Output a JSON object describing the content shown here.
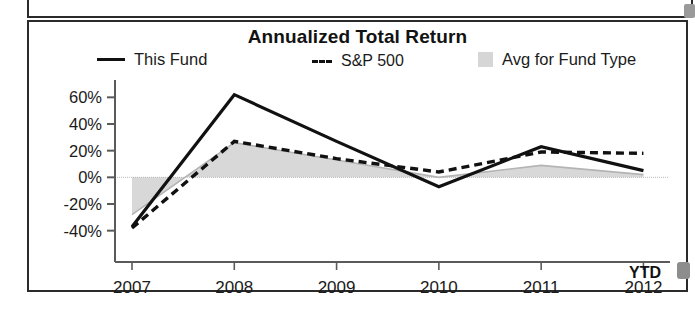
{
  "panel": {
    "title": "Annualized Total Return"
  },
  "legend": {
    "items": [
      {
        "label": "This Fund",
        "marker": "solid-line",
        "color": "#111111"
      },
      {
        "label": "S&P 500",
        "marker": "dashed-line",
        "color": "#111111"
      },
      {
        "label": "Avg for Fund Type",
        "marker": "shaded-area",
        "color": "#d6d6d6"
      }
    ]
  },
  "axis": {
    "x_suffix_label": "YTD",
    "y_ticks": [
      "60%",
      "40%",
      "20%",
      "0%",
      "-20%",
      "-40%"
    ],
    "x_ticks": [
      "2007",
      "2008",
      "2009",
      "2010",
      "2011",
      "2012"
    ]
  },
  "chart_data": {
    "type": "line",
    "title": "Annualized Total Return",
    "xlabel": "",
    "ylabel": "",
    "x": [
      "2007",
      "2008",
      "2009",
      "2010",
      "2011",
      "2012"
    ],
    "x_note": "2012 value is YTD",
    "ylim": [
      -50,
      70
    ],
    "y_ticks": [
      -40,
      -20,
      0,
      20,
      40,
      60
    ],
    "grid": false,
    "legend_position": "top",
    "series": [
      {
        "name": "This Fund",
        "style": "solid",
        "color": "#111111",
        "values": [
          -37,
          62,
          27,
          -7,
          23,
          5
        ]
      },
      {
        "name": "S&P 500",
        "style": "dashed",
        "color": "#111111",
        "values": [
          -38,
          27,
          14,
          4,
          19,
          18
        ]
      },
      {
        "name": "Avg for Fund Type",
        "style": "area",
        "color": "#d6d6d6",
        "values": [
          -28,
          26,
          13,
          0,
          9,
          2
        ]
      }
    ]
  }
}
